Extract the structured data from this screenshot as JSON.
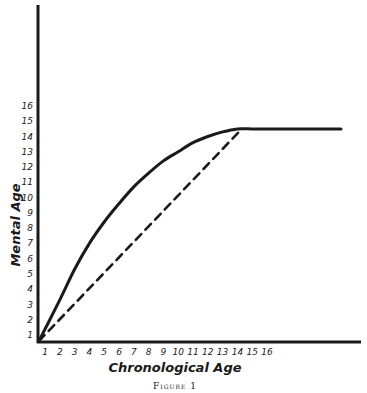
{
  "chart_data": {
    "type": "line",
    "title": "",
    "caption": "Figure 1",
    "xlabel": "Chronological Age",
    "ylabel": "Mental Age",
    "x_ticks": [
      "1",
      "2",
      "3",
      "4",
      "5",
      "6",
      "7",
      "8",
      "9",
      "10",
      "11",
      "12",
      "13",
      "14",
      "15",
      "16"
    ],
    "y_ticks": [
      "1",
      "2",
      "3",
      "4",
      "5",
      "6",
      "7",
      "8",
      "9",
      "10",
      "11",
      "12",
      "13",
      "14",
      "15",
      "16"
    ],
    "xlim": [
      1,
      22
    ],
    "ylim": [
      1,
      16
    ],
    "grid": false,
    "legend": "none",
    "series": [
      {
        "name": "Mental growth curve",
        "style": "solid",
        "x": [
          1,
          2,
          3,
          4,
          5,
          6,
          7,
          8,
          9,
          10,
          11,
          12,
          13,
          14,
          15,
          16,
          18,
          20,
          21
        ],
        "y": [
          1,
          3.3,
          5.3,
          7.0,
          8.4,
          9.6,
          10.7,
          11.6,
          12.4,
          13.0,
          13.6,
          14.0,
          14.3,
          14.5,
          14.5,
          14.5,
          14.5,
          14.5,
          14.5
        ]
      },
      {
        "name": "Linear reference",
        "style": "dashed",
        "x": [
          1,
          14.3
        ],
        "y": [
          1,
          14.5
        ]
      }
    ]
  },
  "labels": {
    "x_axis": "Chronological Age",
    "y_axis": "Mental Age",
    "caption": "Figure 1"
  }
}
